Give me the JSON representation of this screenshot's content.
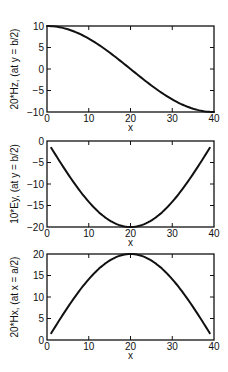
{
  "chart_data": [
    {
      "type": "line",
      "title": "",
      "xlabel": "x",
      "ylabel": "20*Hz, (at y = b/2)",
      "xlim": [
        0,
        40
      ],
      "ylim": [
        -10,
        10
      ],
      "xticks": [
        0,
        10,
        20,
        30,
        40
      ],
      "yticks": [
        -10,
        -5,
        0,
        5,
        10
      ],
      "grid": false,
      "series": [
        {
          "name": "20*Hz",
          "x": [
            0,
            4,
            8,
            12,
            16,
            20,
            24,
            28,
            32,
            36,
            40
          ],
          "y": [
            10,
            9.51,
            8.09,
            5.88,
            3.09,
            0,
            -3.09,
            -5.88,
            -8.09,
            -9.51,
            -10
          ]
        }
      ]
    },
    {
      "type": "line",
      "title": "",
      "xlabel": "x",
      "ylabel": "10*Ey, (at y = b/2)",
      "xlim": [
        0,
        40
      ],
      "ylim": [
        -20,
        0
      ],
      "xticks": [
        0,
        10,
        20,
        30,
        40
      ],
      "yticks": [
        -20,
        -15,
        -10,
        -5,
        0
      ],
      "grid": false,
      "series": [
        {
          "name": "10*Ey",
          "x": [
            1,
            4,
            8,
            12,
            16,
            20,
            24,
            28,
            32,
            36,
            39
          ],
          "y": [
            -1.6,
            -6.2,
            -11.8,
            -16.2,
            -19.0,
            -20,
            -19.0,
            -16.2,
            -11.8,
            -6.2,
            -1.6
          ]
        }
      ]
    },
    {
      "type": "line",
      "title": "",
      "xlabel": "x",
      "ylabel": "20*Hx, (at x = a/2)",
      "xlim": [
        0,
        40
      ],
      "ylim": [
        0,
        20
      ],
      "xticks": [
        0,
        10,
        20,
        30,
        40
      ],
      "yticks": [
        0,
        5,
        10,
        15,
        20
      ],
      "grid": false,
      "series": [
        {
          "name": "20*Hx",
          "x": [
            1,
            4,
            8,
            12,
            16,
            20,
            24,
            28,
            32,
            36,
            39
          ],
          "y": [
            1.6,
            6.2,
            11.8,
            16.2,
            19.0,
            20,
            19.0,
            16.2,
            11.8,
            6.2,
            1.6
          ]
        }
      ]
    }
  ]
}
